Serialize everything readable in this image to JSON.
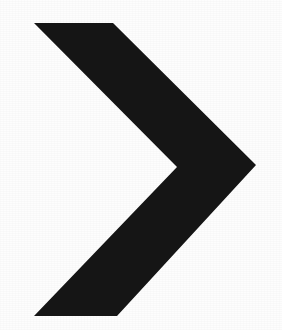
{
  "canvas": {
    "width": 282,
    "height": 330,
    "background_color": "#fdfdfd"
  },
  "figure": {
    "name": "chevron-right-glyph",
    "symbol": "›",
    "fill_color": "#151515",
    "stroke_color": "none",
    "alt_text": "Right-pointing chevron",
    "points": "34,23 113,23 256,165 117,316 34,316 177,167",
    "vertices": [
      {
        "name": "top-left-tip",
        "x": 34,
        "y": 23
      },
      {
        "name": "top-edge-right-end",
        "x": 113,
        "y": 23
      },
      {
        "name": "right-outer-tip",
        "x": 256,
        "y": 165
      },
      {
        "name": "bottom-edge-right-end",
        "x": 117,
        "y": 316
      },
      {
        "name": "bottom-left-tip",
        "x": 34,
        "y": 316
      },
      {
        "name": "inner-notch-vertex",
        "x": 177,
        "y": 167
      }
    ]
  }
}
